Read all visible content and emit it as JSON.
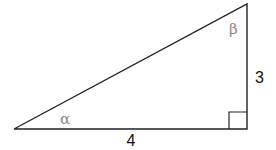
{
  "diagram": {
    "type": "right-triangle",
    "vertices": {
      "alpha_vertex": [
        14,
        129
      ],
      "right_angle_vertex": [
        247,
        129
      ],
      "beta_vertex": [
        247,
        4
      ]
    },
    "labels": {
      "base": "4",
      "height": "3",
      "alpha": "α",
      "beta": "β"
    },
    "colors": {
      "stroke": "#222222",
      "angle_label": "#8a8a8a",
      "side_label": "#111111"
    }
  }
}
